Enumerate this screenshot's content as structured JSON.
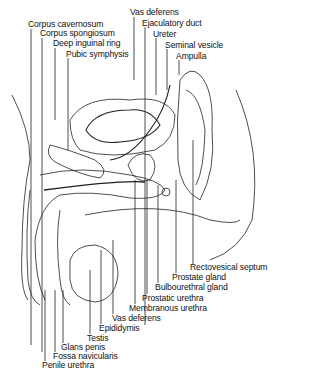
{
  "diagram": {
    "labels_top_left": [
      {
        "text": "Corpus cavernosum",
        "x": 28,
        "y": 20
      },
      {
        "text": "Corpus spongiosum",
        "x": 40,
        "y": 29
      },
      {
        "text": "Deep inguinal ring",
        "x": 53,
        "y": 39
      },
      {
        "text": "Pubic symphysis",
        "x": 66,
        "y": 50
      }
    ],
    "labels_top_right": [
      {
        "text": "Vas deferens",
        "x": 130,
        "y": 8
      },
      {
        "text": "Ejaculatory duct",
        "x": 142,
        "y": 19
      },
      {
        "text": "Ureter",
        "x": 153,
        "y": 30
      },
      {
        "text": "Seminal vesicle",
        "x": 165,
        "y": 41
      },
      {
        "text": "Ampulla",
        "x": 176,
        "y": 52
      }
    ],
    "labels_bottom_right": [
      {
        "text": "Rectovesical septum",
        "x": 190,
        "y": 263
      },
      {
        "text": "Prostate gland",
        "x": 172,
        "y": 273
      },
      {
        "text": "Bulbourethral gland",
        "x": 155,
        "y": 283
      },
      {
        "text": "Prostatic urethra",
        "x": 142,
        "y": 294
      },
      {
        "text": "Membranous urethra",
        "x": 129,
        "y": 304
      },
      {
        "text": "Vas deferens",
        "x": 112,
        "y": 314
      }
    ],
    "labels_bottom_left": [
      {
        "text": "Epididymis",
        "x": 99,
        "y": 324
      },
      {
        "text": "Testis",
        "x": 87,
        "y": 334
      },
      {
        "text": "Glans penis",
        "x": 61,
        "y": 343
      },
      {
        "text": "Fossa navicularis",
        "x": 53,
        "y": 352
      },
      {
        "text": "Penile urethra",
        "x": 42,
        "y": 361
      }
    ]
  }
}
